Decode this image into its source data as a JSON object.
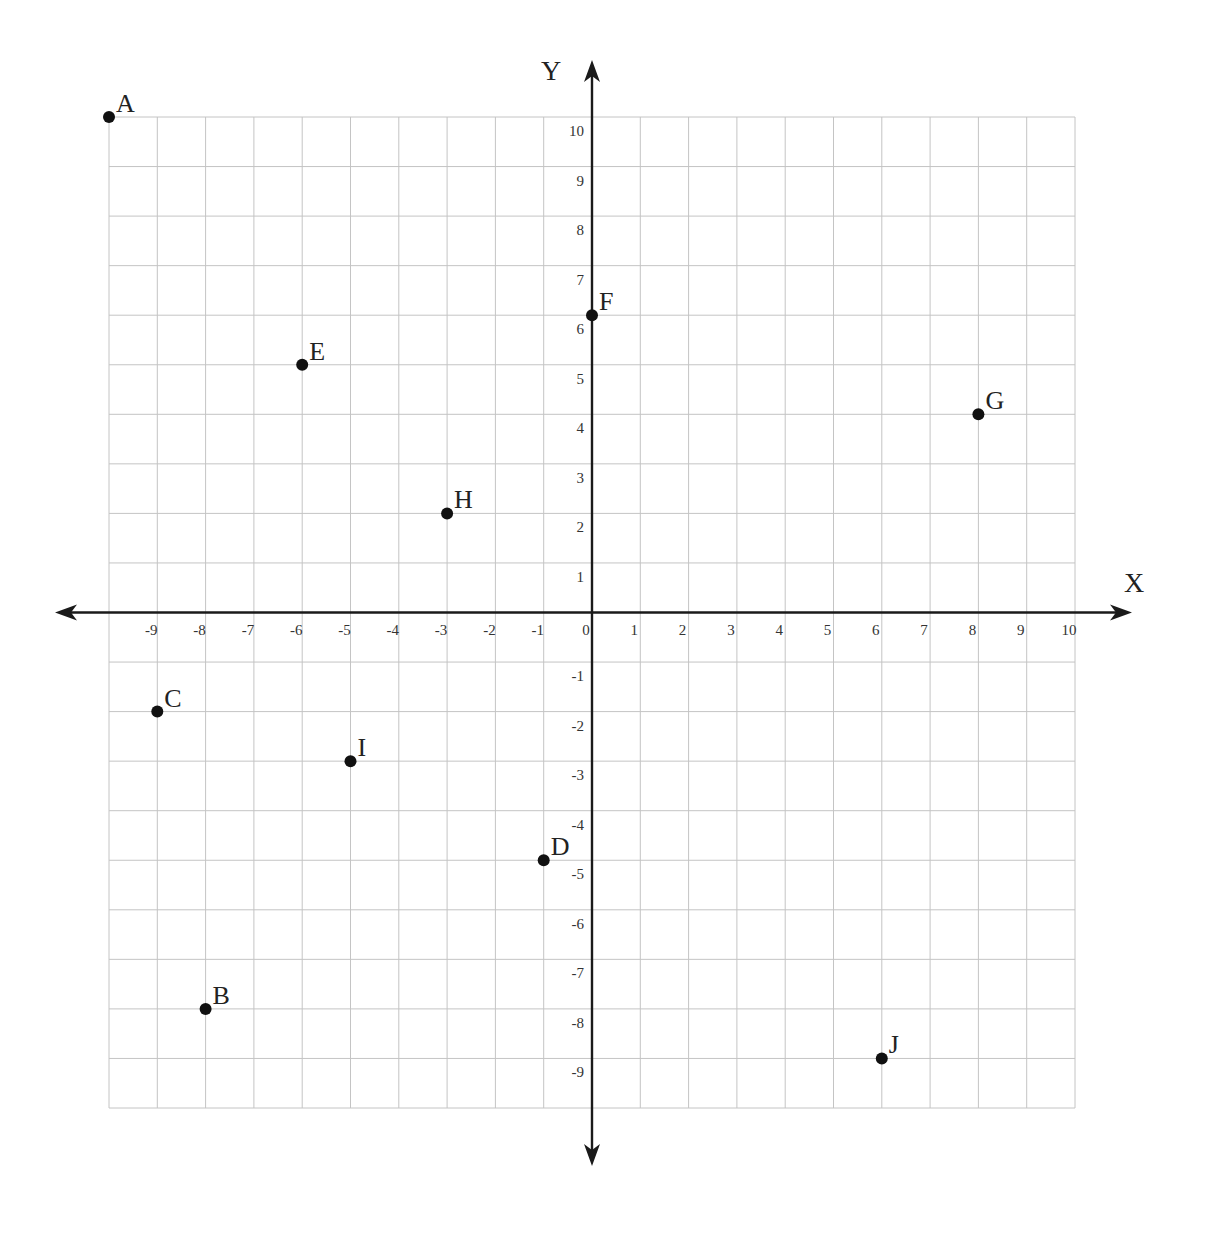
{
  "chart_data": {
    "type": "scatter",
    "title": "",
    "xlabel": "X",
    "ylabel": "Y",
    "xlim": [
      -10,
      10
    ],
    "ylim": [
      -10,
      10
    ],
    "grid": true,
    "legend": null,
    "x_tick_labels": [
      "-9",
      "-8",
      "-7",
      "-6",
      "-5",
      "-4",
      "-3",
      "-2",
      "-1",
      "0",
      "1",
      "2",
      "3",
      "4",
      "5",
      "6",
      "7",
      "8",
      "9",
      "10"
    ],
    "y_tick_labels": [
      "10",
      "9",
      "8",
      "7",
      "6",
      "5",
      "4",
      "3",
      "2",
      "1",
      "-1",
      "-2",
      "-3",
      "-4",
      "-5",
      "-6",
      "-7",
      "-8",
      "-9"
    ],
    "points": [
      {
        "label": "A",
        "x": -10,
        "y": 10
      },
      {
        "label": "B",
        "x": -8,
        "y": -8
      },
      {
        "label": "C",
        "x": -9,
        "y": -2
      },
      {
        "label": "D",
        "x": -1,
        "y": -5
      },
      {
        "label": "E",
        "x": -6,
        "y": 5
      },
      {
        "label": "F",
        "x": 0,
        "y": 6
      },
      {
        "label": "G",
        "x": 8,
        "y": 4
      },
      {
        "label": "H",
        "x": -3,
        "y": 2
      },
      {
        "label": "I",
        "x": -5,
        "y": -3
      },
      {
        "label": "J",
        "x": 6,
        "y": -9
      }
    ]
  },
  "axes": {
    "x_title": "X",
    "y_title": "Y"
  },
  "colors": {
    "grid": "#c4c4c4",
    "axis": "#1a1a1a",
    "point": "#111111",
    "text": "#222222"
  }
}
